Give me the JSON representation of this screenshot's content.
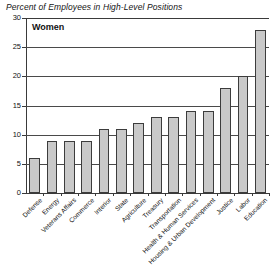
{
  "chart_data": {
    "type": "bar",
    "title": "Percent of Employees in High-Level Positions",
    "series_label": "Women",
    "xlabel": "",
    "ylabel": "",
    "ylim": [
      0,
      30
    ],
    "yticks": [
      0,
      5,
      10,
      15,
      20,
      25,
      30
    ],
    "ytick_labels": [
      "0",
      "5",
      "10",
      "15",
      "20",
      "25",
      "30"
    ],
    "grid": true,
    "legend_position": "none",
    "bar_color": "#c9c9c9",
    "bar_edge_color": "#3c3c3c",
    "axis_color": "#3a3a3a",
    "categories": [
      "Defense",
      "Energy",
      "Veterans Affairs",
      "Commerce",
      "Interior",
      "State",
      "Agriculture",
      "Treasury",
      "Transportation",
      "Health & Human Services",
      "Housing & Urban Development",
      "Justice",
      "Labor",
      "Education"
    ],
    "values": [
      6,
      9,
      9,
      9,
      11,
      11,
      12,
      13,
      13,
      14,
      14,
      18,
      20,
      28
    ]
  }
}
